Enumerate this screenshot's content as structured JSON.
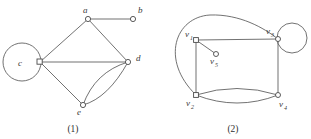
{
  "figure": {
    "background_color": "#ffffff",
    "stroke_color": "#585858",
    "label_color": "#3a3a3a",
    "graphs": [
      {
        "id": "graph-1",
        "caption": "(1)",
        "caption_x": 73,
        "caption_y": 132,
        "vertices": [
          {
            "name": "a",
            "label": "a",
            "sub": "",
            "x": 88,
            "y": 19,
            "lx": 83,
            "ly": 13
          },
          {
            "name": "b",
            "label": "b",
            "sub": "",
            "x": 133,
            "y": 19,
            "lx": 138,
            "ly": 13
          },
          {
            "name": "c",
            "label": "c",
            "sub": "",
            "x": 40,
            "y": 62,
            "lx": 21,
            "ly": 66
          },
          {
            "name": "d",
            "label": "d",
            "sub": "",
            "x": 128,
            "y": 62,
            "lx": 136,
            "ly": 61
          },
          {
            "name": "e",
            "label": "e",
            "sub": "",
            "x": 83,
            "y": 105,
            "lx": 78,
            "ly": 114
          }
        ],
        "edges": [
          {
            "name": "edge-a-b",
            "d": "M 88 19 L 133 19"
          },
          {
            "name": "edge-a-c",
            "d": "M 88 19 L 40 62"
          },
          {
            "name": "edge-a-d",
            "d": "M 88 19 L 128 62"
          },
          {
            "name": "edge-c-d",
            "d": "M 40 62 L 128 62"
          },
          {
            "name": "edge-c-e",
            "d": "M 40 62 L 83 105"
          },
          {
            "name": "edge-d-e-upper",
            "d": "M 128 62 Q 95 72 83 105"
          },
          {
            "name": "edge-d-e-lower",
            "d": "M 128 62 Q 108 98 83 105"
          }
        ],
        "loops": [
          {
            "name": "self-loop-c",
            "cx": 22,
            "cy": 62,
            "r": 19
          }
        ]
      },
      {
        "id": "graph-2",
        "caption": "(2)",
        "caption_x": 233,
        "caption_y": 132,
        "vertices": [
          {
            "name": "v1",
            "label": "v",
            "sub": "1",
            "x": 196,
            "y": 40,
            "lx": 186,
            "ly": 36
          },
          {
            "name": "v2",
            "label": "v",
            "sub": "2",
            "x": 196,
            "y": 95,
            "lx": 188,
            "ly": 106
          },
          {
            "name": "v3",
            "label": "v",
            "sub": "3",
            "x": 278,
            "y": 39,
            "lx": 268,
            "ly": 34
          },
          {
            "name": "v4",
            "label": "v",
            "sub": "4",
            "x": 278,
            "y": 95,
            "lx": 280,
            "ly": 106
          },
          {
            "name": "v5",
            "label": "v",
            "sub": "5",
            "x": 216,
            "y": 54,
            "lx": 211,
            "ly": 64
          }
        ],
        "edges": [
          {
            "name": "edge-v1-v3",
            "d": "M 196 40 L 278 39"
          },
          {
            "name": "edge-v1-v5",
            "d": "M 196 40 L 216 54"
          },
          {
            "name": "edge-v1-v2",
            "d": "M 196 40 L 196 95"
          },
          {
            "name": "edge-v2-v3-curve",
            "d": "M 196 95 C 160 60 175 17 210 15 C 240 14 264 28 278 39"
          },
          {
            "name": "edge-v3-v4",
            "d": "M 278 39 L 278 95"
          },
          {
            "name": "edge-v2-v4-upper",
            "d": "M 196 95 Q 237 82 278 95"
          },
          {
            "name": "edge-v2-v4-lower",
            "d": "M 196 95 Q 237 111 278 95"
          }
        ],
        "loops": [
          {
            "name": "self-loop-v3",
            "cx": 292,
            "cy": 38,
            "r": 15
          }
        ]
      }
    ]
  }
}
